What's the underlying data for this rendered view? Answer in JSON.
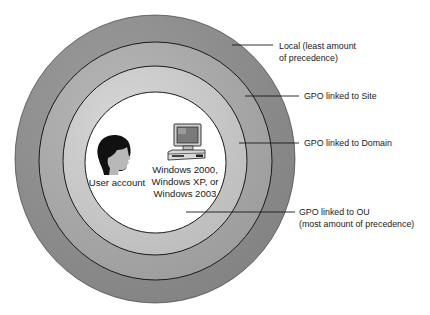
{
  "diagram": {
    "type": "concentric-precedence",
    "rings": [
      {
        "name": "Local",
        "fill": "#8e8e8e"
      },
      {
        "name": "Site",
        "fill": "#a9a9a9"
      },
      {
        "name": "Domain",
        "fill": "#c9c9c9"
      },
      {
        "name": "OU",
        "fill": "#ffffff"
      }
    ],
    "labels": {
      "local": {
        "line1": "Local (least amount",
        "line2": "of precedence)"
      },
      "site": {
        "line1": "GPO linked to Site"
      },
      "domain": {
        "line1": "GPO linked to Domain"
      },
      "ou": {
        "line1": "GPO linked to OU",
        "line2": "(most amount of precedence)"
      }
    },
    "center": {
      "user": {
        "icon": "user-head-icon",
        "label": "User account"
      },
      "computer": {
        "icon": "computer-icon",
        "line1": "Windows 2000,",
        "line2": "Windows XP, or",
        "line3": "Windows 2003"
      }
    }
  }
}
